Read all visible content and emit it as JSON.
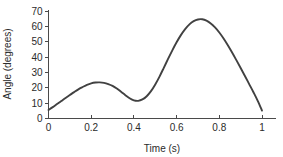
{
  "chart_data": {
    "type": "line",
    "title": "",
    "xlabel": "Time (s)",
    "ylabel": "Angle (degrees)",
    "xlim": [
      0,
      1
    ],
    "ylim": [
      0,
      70
    ],
    "grid": false,
    "legend": false,
    "line_color": "#414141",
    "axis_color": "#4a4a4a",
    "background_color": "#ffffff",
    "x_ticks": [
      0,
      0.2,
      0.4,
      0.6,
      0.8,
      1
    ],
    "x_tick_labels": [
      "0",
      "0.2",
      "0.4",
      "0.6",
      "0.8",
      "1"
    ],
    "y_ticks": [
      0,
      10,
      20,
      30,
      40,
      50,
      60,
      70
    ],
    "y_tick_labels": [
      "0",
      "10",
      "20",
      "30",
      "40",
      "50",
      "60",
      "70"
    ],
    "series": [
      {
        "name": "angle",
        "x": [
          0.0,
          0.02,
          0.04,
          0.06,
          0.08,
          0.1,
          0.12,
          0.14,
          0.16,
          0.18,
          0.2,
          0.22,
          0.24,
          0.26,
          0.28,
          0.3,
          0.32,
          0.34,
          0.36,
          0.38,
          0.4,
          0.42,
          0.44,
          0.46,
          0.48,
          0.5,
          0.52,
          0.54,
          0.56,
          0.58,
          0.6,
          0.62,
          0.64,
          0.66,
          0.68,
          0.7,
          0.72,
          0.74,
          0.76,
          0.78,
          0.8,
          0.82,
          0.84,
          0.86,
          0.88,
          0.9,
          0.92,
          0.94,
          0.96,
          0.98,
          1.0
        ],
        "y": [
          5.5,
          7.4,
          9.4,
          11.4,
          13.4,
          15.3,
          17.2,
          19.0,
          20.5,
          21.9,
          22.9,
          23.4,
          23.5,
          23.2,
          22.4,
          21.2,
          19.5,
          17.4,
          15.2,
          13.2,
          11.8,
          11.5,
          12.4,
          14.5,
          17.8,
          22.2,
          27.3,
          33.0,
          38.8,
          44.4,
          49.6,
          54.3,
          58.2,
          61.3,
          63.4,
          64.5,
          64.6,
          63.7,
          61.9,
          59.3,
          56.0,
          52.1,
          47.7,
          43.0,
          38.0,
          32.9,
          27.7,
          22.4,
          17.1,
          11.5,
          5.2
        ],
        "annotations": {
          "first_peak": {
            "x": 0.21,
            "y": 23.5
          },
          "valley": {
            "x": 0.41,
            "y": 11.5
          },
          "main_peak": {
            "x": 0.71,
            "y": 64.6
          },
          "start": {
            "x": 0.0,
            "y": 5.5
          },
          "end": {
            "x": 1.0,
            "y": 5.2
          }
        }
      }
    ]
  }
}
